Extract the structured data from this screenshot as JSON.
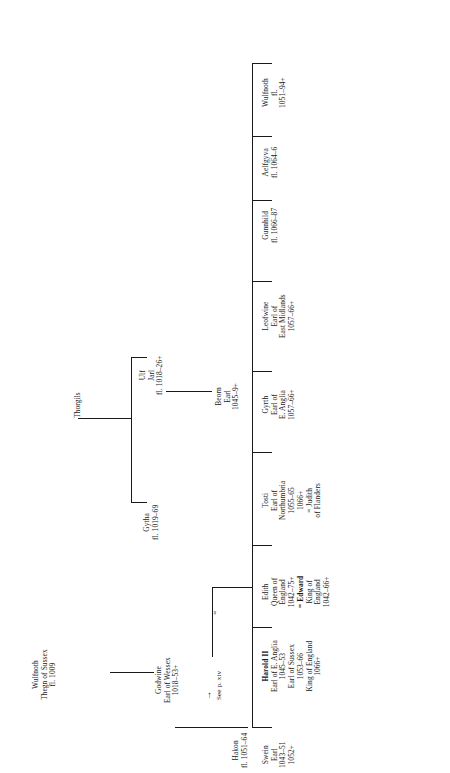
{
  "figure": {
    "type": "genealogy-tree",
    "orientation": "rotated-90-ccw",
    "line_color": "#1a1a1a",
    "background": "#ffffff"
  },
  "nodes": {
    "thorgils": {
      "id": "thorgils",
      "lines": [
        "Thorgils"
      ]
    },
    "wulfnoth_thegn": {
      "id": "wulfnoth-thegn",
      "lines": [
        "Wulfnoth",
        "Thegn of Sussex",
        "fl. 1009"
      ]
    },
    "ulf": {
      "id": "ulf",
      "lines": [
        "Ulf",
        "Jarl",
        "fl. 1018–26+"
      ]
    },
    "gytha": {
      "id": "gytha",
      "lines": [
        "Gytha",
        "fl. 1019–69"
      ]
    },
    "godwine": {
      "id": "godwine",
      "lines": [
        "Godwine",
        "Earl of Wessex",
        "1018–53+"
      ]
    },
    "beorn": {
      "id": "beorn",
      "lines": [
        "Beorn",
        "Earl",
        "1045–9+"
      ]
    },
    "swein": {
      "id": "swein",
      "lines": [
        "Swein",
        "Earl",
        "1043–51",
        "1052+"
      ]
    },
    "harold": {
      "id": "harold",
      "bold_first_line": true,
      "lines": [
        "Harold II",
        "Earl of E. Anglia",
        "1045–53",
        "Earl of Sussex",
        "1053–66",
        "King of England",
        "1066+"
      ]
    },
    "edith": {
      "id": "edith",
      "lines": [
        "Edith",
        "Queen of",
        "England",
        "1042–75+",
        "= Edward",
        "King of",
        "England",
        "1042–66+"
      ],
      "bold_spouse": "Edward"
    },
    "tosti": {
      "id": "tosti",
      "lines": [
        "Tosti",
        "Earl of",
        "Northumbria",
        "1055–65",
        "1066+",
        "= Judith",
        "of Flanders"
      ]
    },
    "gyrth": {
      "id": "gyrth",
      "lines": [
        "Gyrth",
        "Earl of",
        "E. Anglia",
        "1057–66+"
      ]
    },
    "leofwine": {
      "id": "leofwine",
      "lines": [
        "Leofwine",
        "Earl of",
        "East Midlands",
        "1057–66+"
      ]
    },
    "gunnhild": {
      "id": "gunnhild",
      "lines": [
        "Gunnhild",
        "fl. 1066–87"
      ]
    },
    "aelfgyva": {
      "id": "aelfgyva",
      "lines": [
        "Aelfgyva",
        "fl. 1064–6"
      ]
    },
    "wulfnoth_son": {
      "id": "wulfnoth-son",
      "lines": [
        "Wulfnoth",
        "fl.",
        "1051–94+"
      ]
    },
    "hakon": {
      "id": "hakon",
      "lines": [
        "Hakon",
        "fl. 1051–64"
      ]
    }
  },
  "marks": {
    "marriage_symbol": "=",
    "cross_reference": "See p. xiv",
    "arrow": "→"
  }
}
